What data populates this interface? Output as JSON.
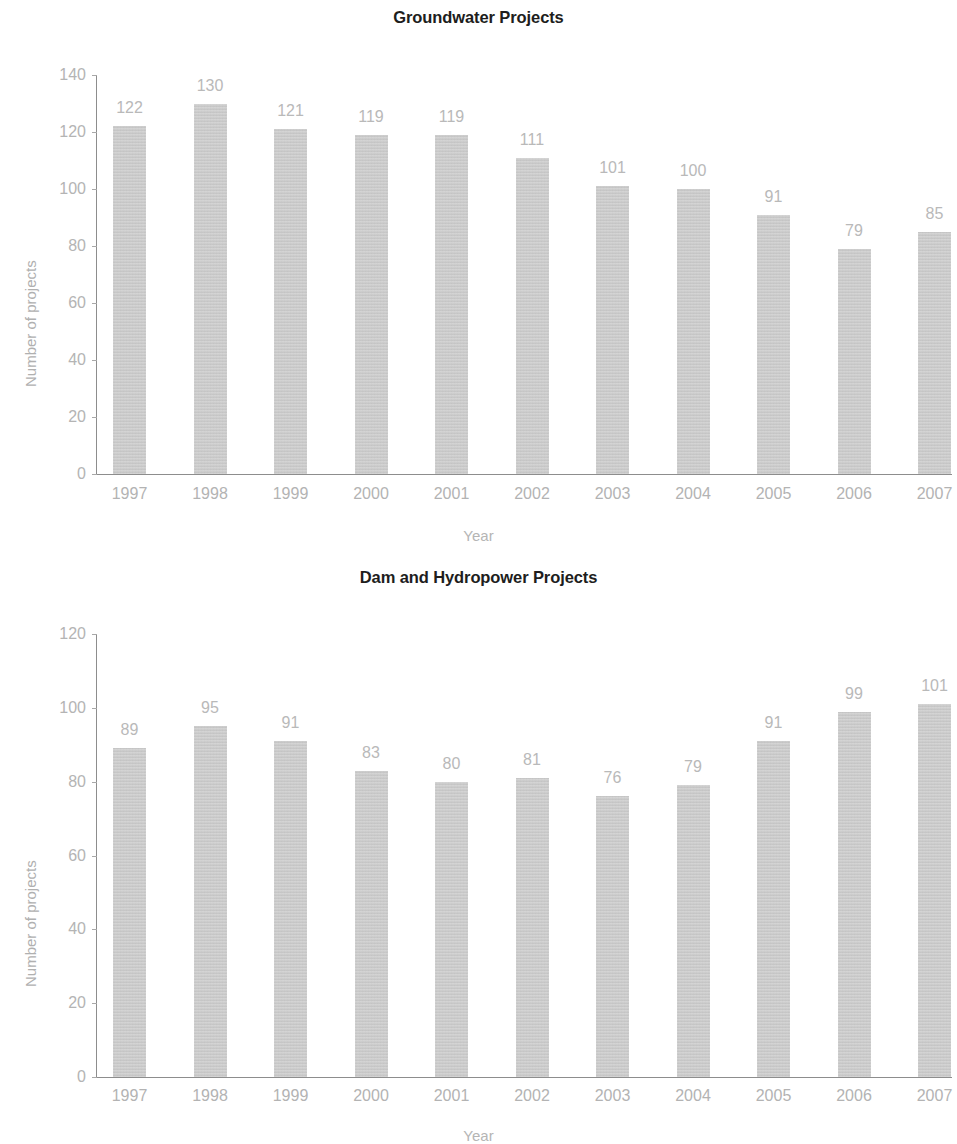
{
  "page": {
    "background": "#ffffff",
    "bar_color": "#c9c9c9",
    "label_color": "#b6b6b6",
    "title_color": "#201d1c",
    "axis_color": "#8d8d8d"
  },
  "chart_data": [
    {
      "id": "groundwater",
      "type": "bar",
      "title": "Groundwater Projects",
      "xlabel": "Year",
      "ylabel": "Number of projects",
      "categories": [
        "1997",
        "1998",
        "1999",
        "2000",
        "2001",
        "2002",
        "2003",
        "2004",
        "2005",
        "2006",
        "2007"
      ],
      "values": [
        122,
        130,
        121,
        119,
        119,
        111,
        101,
        100,
        91,
        79,
        85
      ],
      "value_labels": [
        "122",
        "130",
        "121",
        "119",
        "119",
        "111",
        "101",
        "100",
        "91",
        "79",
        "85"
      ],
      "ylim": [
        0,
        140
      ],
      "yticks": [
        0,
        20,
        40,
        60,
        80,
        100,
        120,
        140
      ],
      "ytick_labels": [
        "0",
        "20",
        "40",
        "60",
        "80",
        "100",
        "120",
        "140"
      ],
      "grid": false,
      "legend": false
    },
    {
      "id": "dam-hydropower",
      "type": "bar",
      "title": "Dam and Hydropower Projects",
      "xlabel": "Year",
      "ylabel": "Number of projects",
      "categories": [
        "1997",
        "1998",
        "1999",
        "2000",
        "2001",
        "2002",
        "2003",
        "2004",
        "2005",
        "2006",
        "2007"
      ],
      "values": [
        89,
        95,
        91,
        83,
        80,
        81,
        76,
        79,
        91,
        99,
        101
      ],
      "value_labels": [
        "89",
        "95",
        "91",
        "83",
        "80",
        "81",
        "76",
        "79",
        "91",
        "99",
        "101"
      ],
      "ylim": [
        0,
        120
      ],
      "yticks": [
        0,
        20,
        40,
        60,
        80,
        100,
        120
      ],
      "ytick_labels": [
        "0",
        "20",
        "40",
        "60",
        "80",
        "100",
        "120"
      ],
      "grid": false,
      "legend": false
    }
  ]
}
